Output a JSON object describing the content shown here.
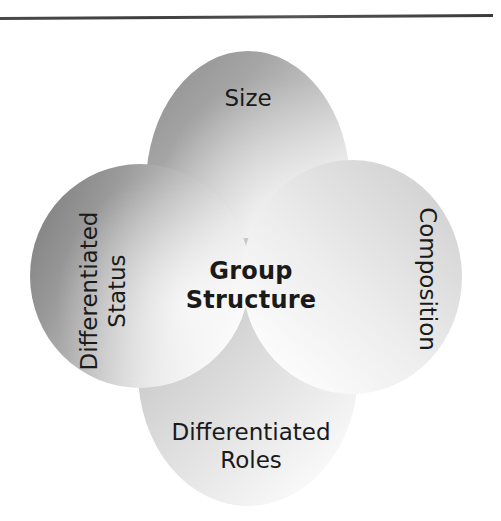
{
  "figure": {
    "type": "four-petal-overlapping-ellipse-diagram",
    "center_label": "Group Structure",
    "center_label_lines": [
      "Group",
      "Structure"
    ],
    "background_color": "#ffffff",
    "text_color": "#1a1a1a",
    "top_rule": {
      "name": "horizontal-rule",
      "color": "#3f3f3f"
    },
    "petals": [
      {
        "id": "top",
        "label": "Size",
        "orientation": "horizontal",
        "fill_light": "#fbfbfb",
        "fill_dark": "#9a9a9a"
      },
      {
        "id": "right",
        "label": "Composition",
        "orientation": "vertical-clockwise",
        "fill_light": "#fdfdfd",
        "fill_dark": "#cfcfcf"
      },
      {
        "id": "bottom",
        "label": "Differentiated Roles",
        "label_lines": [
          "Differentiated",
          "Roles"
        ],
        "orientation": "horizontal",
        "fill_light": "#fcfcfc",
        "fill_dark": "#c4c4c4"
      },
      {
        "id": "left",
        "label": "Differentiated Status",
        "label_lines": [
          "Differentiated",
          "Status"
        ],
        "orientation": "vertical-counterclockwise",
        "fill_light": "#fafafa",
        "fill_dark": "#8d8d8d"
      }
    ]
  }
}
